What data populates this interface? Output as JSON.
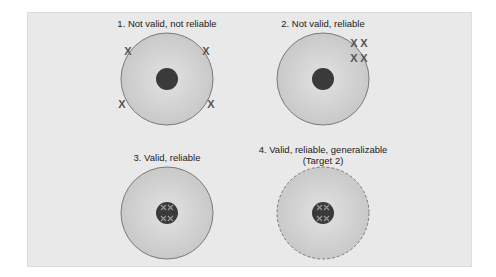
{
  "diagram": {
    "type": "target-bullseye-comparison",
    "colors": {
      "background": "#e9e9e9",
      "ring_fill": "#cfcfcf",
      "ring_stroke": "#7a7a7a",
      "bullseye": "#3a3a3a",
      "marks": "#555555"
    },
    "panels": [
      {
        "id": 1,
        "title": "1. Not valid, not reliable",
        "mark_glyph": "X",
        "marks_placement": "scattered on edge of ring",
        "border_style": "solid"
      },
      {
        "id": 2,
        "title": "2. Not valid, reliable",
        "mark_glyph": "X",
        "marks_placement": "clustered off-center at upper-right edge",
        "border_style": "solid"
      },
      {
        "id": 3,
        "title": "3. Valid, reliable",
        "mark_glyph": "X",
        "marks_placement": "clustered on bullseye",
        "border_style": "solid"
      },
      {
        "id": 4,
        "title_line1": "4. Valid, reliable, generalizable",
        "title_line2": "(Target 2)",
        "mark_glyph": "X",
        "marks_placement": "clustered on bullseye",
        "border_style": "dashed"
      }
    ]
  }
}
